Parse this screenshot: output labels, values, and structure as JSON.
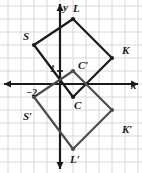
{
  "figure": {
    "name": "coordinate-plane-reflection-figure",
    "grid": {
      "spacing_px": 13,
      "origin_px": {
        "x": 60,
        "y": 84
      },
      "color": "#d8d8d8",
      "background": "#ffffff",
      "x_min": -4.6,
      "x_max": 6.3,
      "y_min": -6.8,
      "y_max": 6.5
    },
    "axes": {
      "color": "#1a1a1a",
      "x_label": "x",
      "y_label": "y",
      "x_tick_label": "−2",
      "y_tick_label": "1"
    },
    "shapes": [
      {
        "name": "quadrilateral-SLKC",
        "color": "#1a1a1a",
        "vertices": [
          {
            "label": "S",
            "x": -2,
            "y": 3
          },
          {
            "label": "L",
            "x": 1,
            "y": 5
          },
          {
            "label": "K",
            "x": 4,
            "y": 2
          },
          {
            "label": "C",
            "x": 1,
            "y": -1
          }
        ]
      },
      {
        "name": "quadrilateral-S-prime-L-prime-K-prime-C-prime",
        "color": "#4d4d4d",
        "vertices": [
          {
            "label": "S′",
            "x": -2,
            "y": -1
          },
          {
            "label": "C′",
            "x": 1,
            "y": 1
          },
          {
            "label": "K′",
            "x": 4,
            "y": -2
          },
          {
            "label": "L′",
            "x": 1,
            "y": -5
          }
        ]
      }
    ],
    "point_labels": [
      {
        "name": "vertex-label-L",
        "text": "L",
        "x": 73,
        "y": 3
      },
      {
        "name": "vertex-label-S",
        "text": "S",
        "x": 23,
        "y": 31
      },
      {
        "name": "vertex-label-K",
        "text": "K",
        "x": 122,
        "y": 45
      },
      {
        "name": "vertex-label-C-prime",
        "text": "C′",
        "x": 78,
        "y": 60
      },
      {
        "name": "vertex-label-C",
        "text": "C",
        "x": 74,
        "y": 100
      },
      {
        "name": "vertex-label-S-prime",
        "text": "S′",
        "x": 23,
        "y": 111
      },
      {
        "name": "vertex-label-K-prime",
        "text": "K′",
        "x": 122,
        "y": 124
      },
      {
        "name": "vertex-label-L-prime",
        "text": "L′",
        "x": 70,
        "y": 154
      },
      {
        "name": "axis-label-y",
        "text": "y",
        "x": 63,
        "y": 2
      },
      {
        "name": "axis-label-x",
        "text": "x",
        "x": 131,
        "y": 80
      },
      {
        "name": "tick-label-1",
        "text": "1",
        "x": 50,
        "y": 64
      },
      {
        "name": "tick-label-minus-2",
        "text": "−2",
        "x": 26,
        "y": 88
      }
    ]
  }
}
